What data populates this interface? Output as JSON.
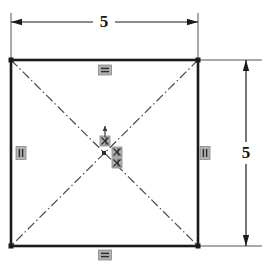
{
  "drawing": {
    "type": "cad-sketch",
    "title": "Square sketch with diagonal construction lines",
    "background_color": "#ffffff",
    "geometry_color": "#1a1a1a",
    "construction_color": "#4a4a4a",
    "dimension_color": "#1a1a1a",
    "constraint_color": "#8a8a8a",
    "constraint_fill": "#b0b0b0"
  },
  "square": {
    "name": "square-profile",
    "left": 11,
    "top": 60,
    "right": 198,
    "bottom": 246,
    "stroke_width": 2.6,
    "corner_point_size": 5
  },
  "construction_lines": [
    {
      "name": "diagonal-tl-br",
      "x1": 11,
      "y1": 60,
      "x2": 198,
      "y2": 246
    },
    {
      "name": "diagonal-tr-bl",
      "x1": 198,
      "y1": 60,
      "x2": 11,
      "y2": 246
    }
  ],
  "dimensions": {
    "horizontal": {
      "label": "5",
      "value": 5,
      "orientation": "horizontal",
      "dim_line_y": 22,
      "x_start": 11,
      "x_end": 198,
      "text_x": 104,
      "text_y": 22,
      "ext_left_x": 11,
      "ext_right_x": 198,
      "ext_top_y": 13,
      "ext_bottom_y": 61
    },
    "vertical": {
      "label": "5",
      "value": 5,
      "orientation": "vertical",
      "dim_line_x": 246,
      "y_start": 60,
      "y_end": 246,
      "text_x": 246,
      "text_y": 153,
      "ext_right_x": 262,
      "ext_left_x": 198,
      "ext_top_y": 60,
      "ext_bottom_y": 246
    }
  },
  "constraints": [
    {
      "name": "constraint-horizontal-top",
      "icon": "horizontal-constraint-icon",
      "cx": 105,
      "cy": 70,
      "w": 13,
      "h": 10,
      "glyph": "horizontal"
    },
    {
      "name": "constraint-horizontal-bottom",
      "icon": "horizontal-constraint-icon",
      "cx": 105,
      "cy": 255,
      "w": 13,
      "h": 10,
      "glyph": "horizontal"
    },
    {
      "name": "constraint-vertical-left",
      "icon": "vertical-constraint-icon",
      "cx": 21,
      "cy": 153,
      "w": 10,
      "h": 13,
      "glyph": "vertical"
    },
    {
      "name": "constraint-vertical-right",
      "icon": "vertical-constraint-icon",
      "cx": 205,
      "cy": 153,
      "w": 10,
      "h": 13,
      "glyph": "vertical"
    },
    {
      "name": "constraint-equal-center-top",
      "icon": "equal-constraint-icon",
      "cx": 105,
      "cy": 141,
      "w": 10,
      "h": 10,
      "glyph": "equal"
    },
    {
      "name": "constraint-equal-center-mid",
      "icon": "equal-constraint-icon",
      "cx": 117,
      "cy": 152,
      "w": 10,
      "h": 10,
      "glyph": "equal"
    },
    {
      "name": "constraint-equal-center-low",
      "icon": "equal-constraint-icon",
      "cx": 117,
      "cy": 163,
      "w": 10,
      "h": 10,
      "glyph": "equal"
    }
  ],
  "center_marker": {
    "name": "sketch-origin-point",
    "cx": 104,
    "cy": 153,
    "arrow_x": 105,
    "arrow_top_y": 126,
    "arrow_bottom_y": 137
  }
}
